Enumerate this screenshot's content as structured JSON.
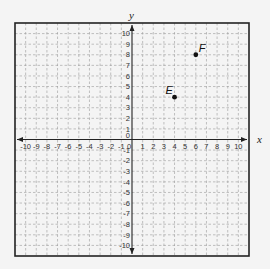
{
  "chart_data": {
    "type": "scatter",
    "title": "",
    "xlabel": "x",
    "ylabel": "y",
    "xlim": [
      -11,
      11
    ],
    "ylim": [
      -11,
      11
    ],
    "grid": true,
    "grid_style": "dashed",
    "x_ticks": [
      -10,
      -9,
      -8,
      -7,
      -6,
      -5,
      -4,
      -3,
      -2,
      -1,
      0,
      1,
      2,
      3,
      4,
      5,
      6,
      7,
      8,
      9,
      10
    ],
    "y_ticks": [
      -10,
      -9,
      -8,
      -7,
      -6,
      -5,
      -4,
      -3,
      -2,
      -1,
      0,
      1,
      2,
      3,
      4,
      5,
      6,
      7,
      8,
      9,
      10
    ],
    "points": [
      {
        "label": "E",
        "x": 4,
        "y": 4
      },
      {
        "label": "F",
        "x": 6,
        "y": 8
      }
    ],
    "legend": null
  },
  "colors": {
    "background": "#f4f4f4",
    "border": "#222222",
    "grid": "#9a9a9a",
    "axis": "#222222",
    "point": "#111111"
  }
}
